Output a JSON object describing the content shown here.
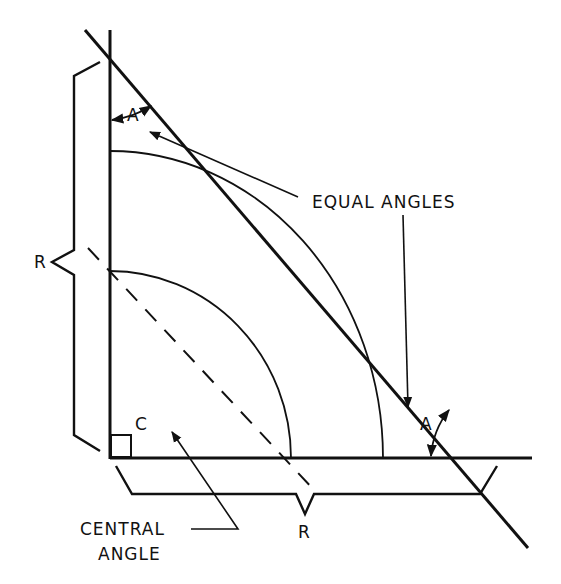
{
  "diagram": {
    "labels": {
      "angle_top": "A",
      "angle_bottom": "A",
      "equal_angles": "EQUAL ANGLES",
      "radius_vertical": "R",
      "radius_horizontal": "R",
      "central_corner": "C",
      "central_angle_line1": "CENTRAL",
      "central_angle_line2": "ANGLE"
    },
    "colors": {
      "stroke": "#111111",
      "background": "#ffffff"
    }
  }
}
